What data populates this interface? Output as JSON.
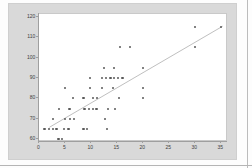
{
  "chart": {
    "panel_color": "#d9d9d9",
    "plot_bg": "#ffffff",
    "dot_color": "#595959",
    "trend_color": "#aeaeae",
    "axis_color": "#9f9f9f",
    "label_color": "#404040"
  },
  "chart_data": {
    "type": "scatter",
    "title": "",
    "xlabel": "",
    "ylabel": "",
    "legend": false,
    "grid": false,
    "xlim": [
      0,
      36.2
    ],
    "ylim": [
      58.5,
      121.5
    ],
    "x_ticks": [
      "0",
      "5",
      "10",
      "15",
      "20",
      "25",
      "30",
      "35"
    ],
    "x_tick_values": [
      0,
      5,
      10,
      15,
      20,
      25,
      30,
      35
    ],
    "y_ticks": [
      "60",
      "70",
      "80",
      "90",
      "100",
      "110",
      "120"
    ],
    "y_tick_values": [
      60,
      70,
      80,
      90,
      100,
      110,
      120
    ],
    "points": [
      [
        3.7,
        60
      ],
      [
        4.4,
        60
      ],
      [
        1,
        65
      ],
      [
        1.8,
        65
      ],
      [
        2.6,
        65
      ],
      [
        3.3,
        65
      ],
      [
        4.8,
        65
      ],
      [
        5.6,
        65
      ],
      [
        8.5,
        65
      ],
      [
        9.2,
        65
      ],
      [
        13,
        65
      ],
      [
        2.7,
        70
      ],
      [
        5,
        70
      ],
      [
        5.9,
        70
      ],
      [
        6.7,
        70
      ],
      [
        12.7,
        70
      ],
      [
        3.8,
        75
      ],
      [
        5.8,
        75
      ],
      [
        8.7,
        75
      ],
      [
        9.5,
        75
      ],
      [
        10.3,
        75
      ],
      [
        11,
        75
      ],
      [
        13.2,
        75
      ],
      [
        14.5,
        75
      ],
      [
        6.5,
        80
      ],
      [
        8.5,
        80
      ],
      [
        10.3,
        80
      ],
      [
        11.1,
        80
      ],
      [
        15.4,
        80
      ],
      [
        20,
        80
      ],
      [
        5,
        85
      ],
      [
        9.7,
        85
      ],
      [
        12,
        85
      ],
      [
        14.2,
        85
      ],
      [
        20,
        85
      ],
      [
        9.8,
        90
      ],
      [
        12.1,
        90
      ],
      [
        12.9,
        90
      ],
      [
        13.7,
        90
      ],
      [
        14.4,
        90
      ],
      [
        15.2,
        90
      ],
      [
        16,
        90
      ],
      [
        12.5,
        95
      ],
      [
        14.4,
        95
      ],
      [
        20,
        95
      ],
      [
        15.5,
        105
      ],
      [
        17.5,
        105
      ],
      [
        30,
        105
      ],
      [
        30,
        115
      ],
      [
        35,
        115
      ]
    ],
    "trend_line": {
      "x1": 2.0,
      "y1": 66.0,
      "x2": 35.3,
      "y2": 115.5
    }
  }
}
